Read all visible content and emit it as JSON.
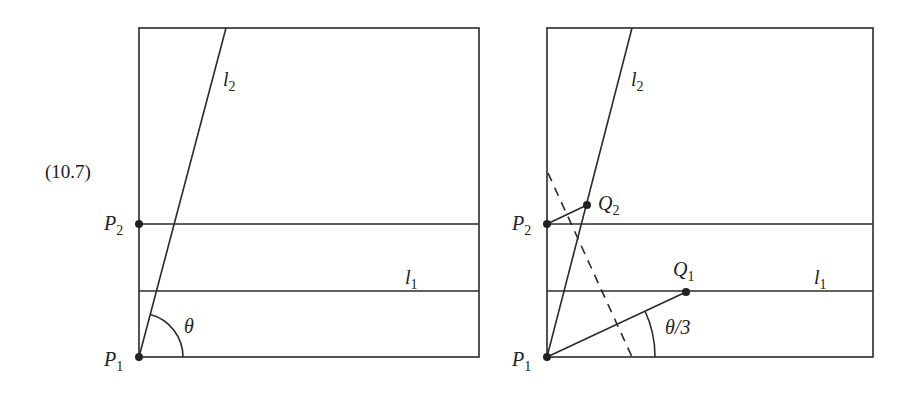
{
  "equation_number": "(10.7)",
  "colors": {
    "ink": "#2a2a2a",
    "background": "#ffffff"
  },
  "left_panel": {
    "points": {
      "P1": {
        "name": "P",
        "sub": "1"
      },
      "P2": {
        "name": "P",
        "sub": "2"
      }
    },
    "lines": {
      "l1": {
        "name": "l",
        "sub": "1"
      },
      "l2": {
        "name": "l",
        "sub": "2"
      }
    },
    "angle_label": "θ"
  },
  "right_panel": {
    "points": {
      "P1": {
        "name": "P",
        "sub": "1"
      },
      "P2": {
        "name": "P",
        "sub": "2"
      },
      "Q1": {
        "name": "Q",
        "sub": "1"
      },
      "Q2": {
        "name": "Q",
        "sub": "2"
      }
    },
    "lines": {
      "l1": {
        "name": "l",
        "sub": "1"
      },
      "l2": {
        "name": "l",
        "sub": "2"
      }
    },
    "angle_label": "θ/3"
  }
}
